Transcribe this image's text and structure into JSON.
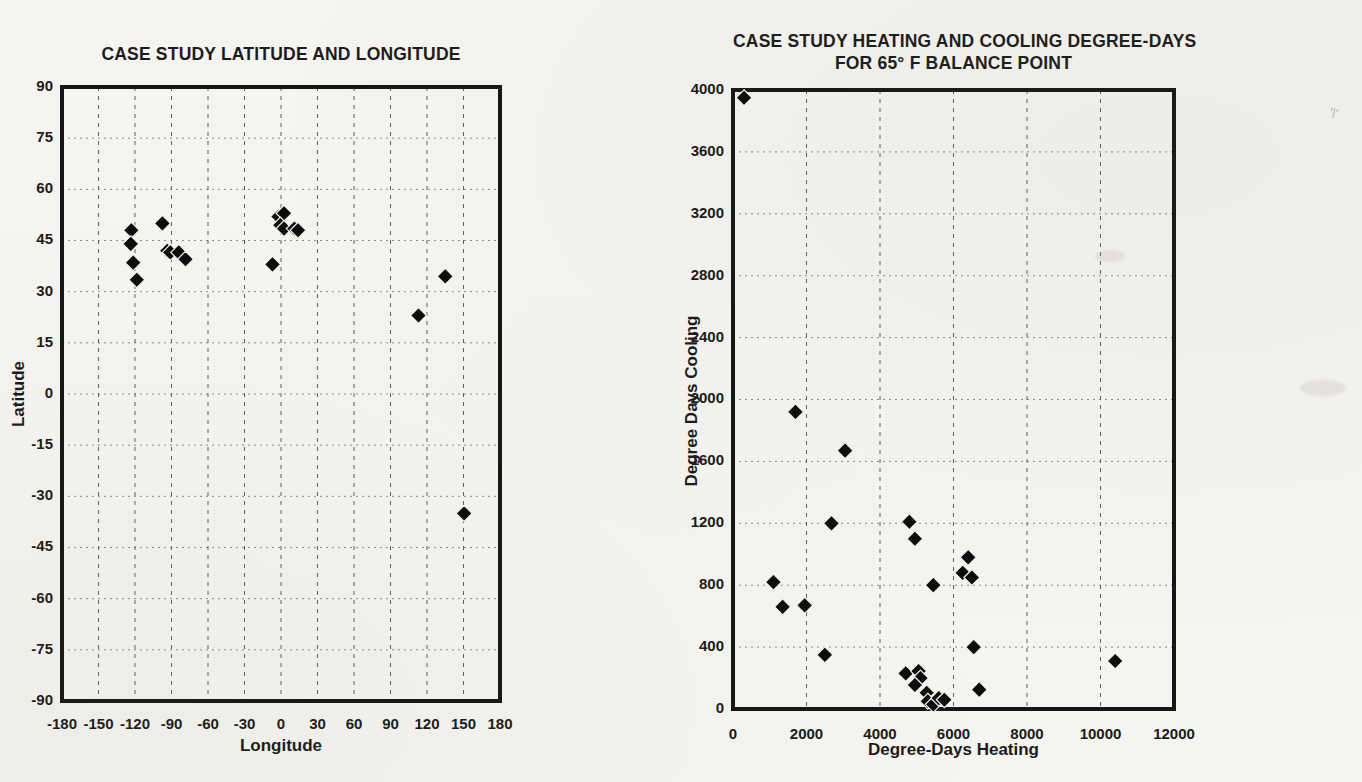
{
  "page": {
    "background": "#f5f4f0",
    "kind": "scanned textbook figure, two scatter plots"
  },
  "chart_data": [
    {
      "type": "scatter",
      "title": "CASE STUDY LATITUDE AND LONGITUDE",
      "xlabel": "Longitude",
      "ylabel": "Latitude",
      "xlim": [
        -180,
        180
      ],
      "ylim": [
        -90,
        90
      ],
      "xticks": [
        -180,
        -150,
        -120,
        -90,
        -60,
        -30,
        0,
        30,
        60,
        90,
        120,
        150,
        180
      ],
      "yticks": [
        90,
        75,
        60,
        45,
        30,
        15,
        0,
        -15,
        -30,
        -45,
        -60,
        -75,
        -90
      ],
      "grid": true,
      "legend": "none",
      "marker": "diamond",
      "marker_color": "#0c0c0c",
      "points": [
        [
          -123,
          48
        ],
        [
          -123.5,
          44
        ],
        [
          -121.5,
          38.5
        ],
        [
          -118.5,
          33.5
        ],
        [
          -97.5,
          50
        ],
        [
          -93.5,
          42
        ],
        [
          -91,
          41.5
        ],
        [
          -84,
          41.5
        ],
        [
          -78.5,
          39.5
        ],
        [
          -7,
          38
        ],
        [
          -2,
          52
        ],
        [
          2.5,
          53
        ],
        [
          -0.5,
          49.5
        ],
        [
          2.5,
          48.5
        ],
        [
          11,
          48.5
        ],
        [
          14,
          48
        ],
        [
          113,
          23
        ],
        [
          135,
          34.5
        ],
        [
          150.5,
          -35
        ]
      ]
    },
    {
      "type": "scatter",
      "title": "CASE STUDY HEATING AND COOLING DEGREE-DAYS",
      "title_line2": "FOR 65° F BALANCE POINT",
      "xlabel": "Degree-Days Heating",
      "ylabel": "Degree Days Cooling",
      "xlim": [
        0,
        12000
      ],
      "ylim": [
        0,
        4000
      ],
      "xticks": [
        0,
        2000,
        4000,
        6000,
        8000,
        10000,
        12000
      ],
      "yticks": [
        0,
        400,
        800,
        1200,
        1600,
        2000,
        2400,
        2800,
        3200,
        3600,
        4000
      ],
      "grid": true,
      "legend": "none",
      "marker": "diamond",
      "marker_color": "#0c0c0c",
      "points": [
        [
          300,
          3950
        ],
        [
          1700,
          1920
        ],
        [
          3050,
          1670
        ],
        [
          2680,
          1200
        ],
        [
          4800,
          1210
        ],
        [
          4950,
          1100
        ],
        [
          6400,
          980
        ],
        [
          6250,
          880
        ],
        [
          6500,
          850
        ],
        [
          5450,
          800
        ],
        [
          1100,
          820
        ],
        [
          1350,
          660
        ],
        [
          1950,
          670
        ],
        [
          2500,
          350
        ],
        [
          6550,
          400
        ],
        [
          10400,
          310
        ],
        [
          6700,
          125
        ],
        [
          4700,
          230
        ],
        [
          5050,
          245
        ],
        [
          5100,
          200
        ],
        [
          4950,
          155
        ],
        [
          5270,
          105
        ],
        [
          5300,
          50
        ],
        [
          5450,
          30
        ],
        [
          5600,
          70
        ],
        [
          5750,
          60
        ]
      ]
    }
  ]
}
